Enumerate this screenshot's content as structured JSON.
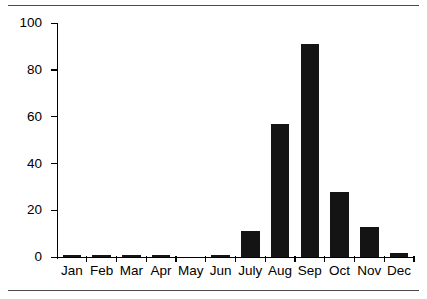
{
  "chart_data": {
    "type": "bar",
    "title": "",
    "subtitle": "",
    "xlabel": "",
    "ylabel": "",
    "categories": [
      "Jan",
      "Feb",
      "Mar",
      "Apr",
      "May",
      "Jun",
      "July",
      "Aug",
      "Sep",
      "Oct",
      "Nov",
      "Dec"
    ],
    "values": [
      1,
      1,
      1,
      1,
      0,
      1,
      11,
      57,
      91,
      28,
      13,
      2
    ],
    "ylim": [
      0,
      100
    ],
    "yticks": [
      0,
      20,
      40,
      60,
      80,
      100
    ],
    "ytick_labels": [
      "0",
      "20",
      "40",
      "60",
      "80",
      "100"
    ],
    "grid": false,
    "legend": null,
    "bar_color": "#141414",
    "axis_color": "#000000"
  },
  "figure": {
    "top_rule_color": "#4a4a4a",
    "bottom_rule_color": "#4a4a4a",
    "background": "#ffffff"
  }
}
